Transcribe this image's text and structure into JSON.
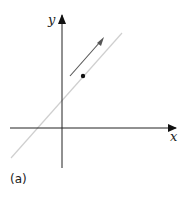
{
  "figure": {
    "caption": "(a)",
    "axes": {
      "x_label": "x",
      "y_label": "y"
    },
    "elements": {
      "line": {
        "description": "light gray diagonal line with positive slope",
        "color": "#cfcfcf"
      },
      "arrow": {
        "description": "direction arrow parallel to line, pointing up-right",
        "color": "#555555"
      },
      "point": {
        "description": "single point above the line",
        "color": "#111111"
      }
    }
  }
}
